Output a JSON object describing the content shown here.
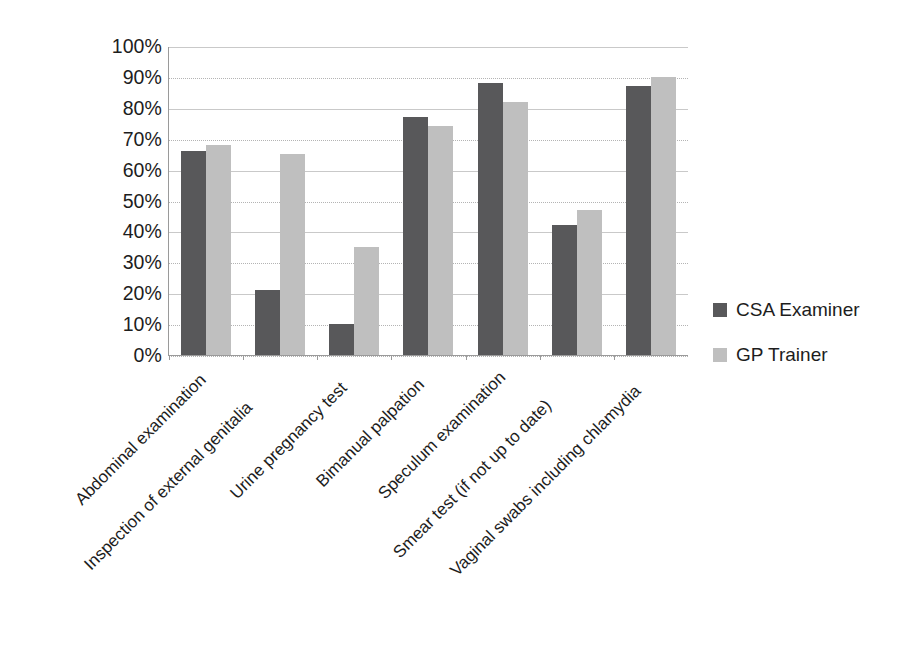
{
  "chart_data": {
    "type": "bar",
    "title": "",
    "subtitle": "",
    "xlabel": "",
    "ylabel": "",
    "ylim": [
      0,
      100
    ],
    "y_unit": "%",
    "grid": true,
    "legend_position": "right",
    "categories": [
      "Abdominal examination",
      "Inspection of external genitalia",
      "Urine pregnancy test",
      "Bimanual palpation",
      "Speculum examination",
      "Smear test (if not up to date)",
      "Vaginal swabs including chlamydia"
    ],
    "y_ticks": [
      "0%",
      "10%",
      "20%",
      "30%",
      "40%",
      "50%",
      "60%",
      "70%",
      "80%",
      "90%",
      "100%"
    ],
    "y_tick_values": [
      0,
      10,
      20,
      30,
      40,
      50,
      60,
      70,
      80,
      90,
      100
    ],
    "series": [
      {
        "name": "CSA Examiner",
        "color": "#58585a",
        "values": [
          66,
          21,
          10,
          77,
          88,
          42,
          87
        ]
      },
      {
        "name": "GP Trainer",
        "color": "#bfbfbf",
        "values": [
          68,
          65,
          35,
          74,
          82,
          47,
          90
        ]
      }
    ]
  },
  "legend": {
    "entries": [
      {
        "label": "CSA Examiner",
        "swatch_color": "#58585a"
      },
      {
        "label": "GP Trainer",
        "swatch_color": "#bfbfbf"
      }
    ]
  }
}
